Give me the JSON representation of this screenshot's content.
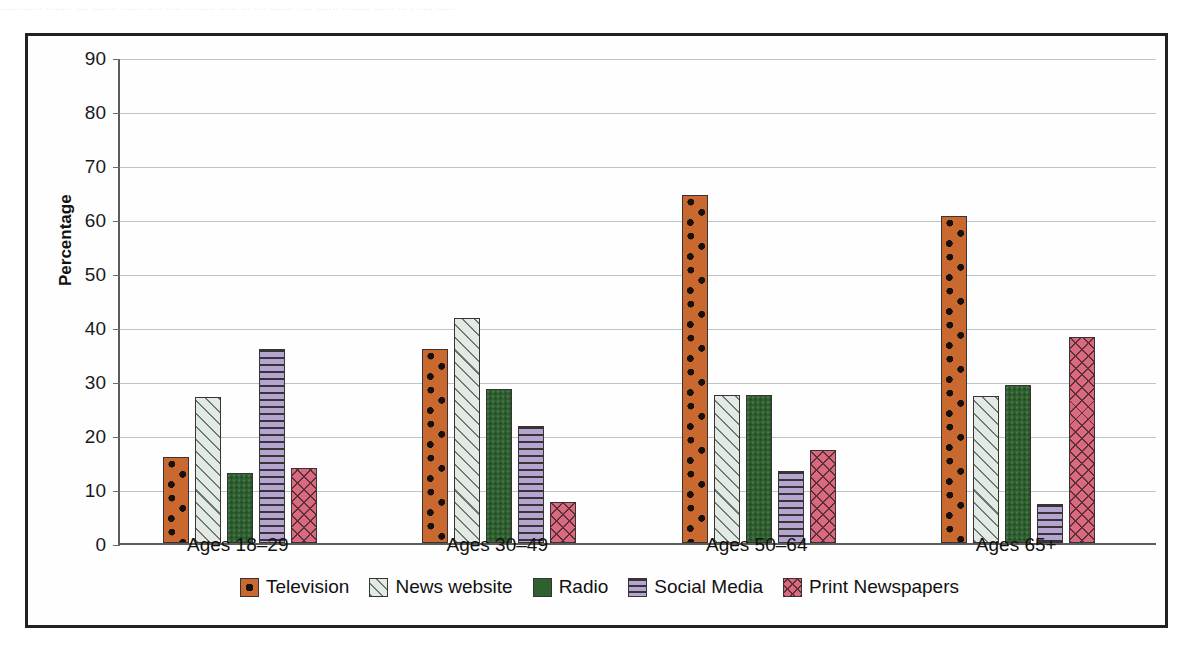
{
  "page": {
    "cropped_header_text": "............. ........ .... ........ ....... ..... ..... ......... ...... ... .... ....... . ... ....... ......... ...... ... . ..... ......"
  },
  "chart_data": {
    "type": "bar",
    "title": "",
    "xlabel": "",
    "ylabel": "Percentage",
    "ylim": [
      0,
      90
    ],
    "yticks": [
      0,
      10,
      20,
      30,
      40,
      50,
      60,
      70,
      80,
      90
    ],
    "ytick_labels": [
      "0",
      "10",
      "20",
      "30",
      "40",
      "50",
      "60",
      "70",
      "80",
      "90"
    ],
    "grid": true,
    "legend_position": "bottom",
    "categories": [
      "Ages 18–29",
      "Ages 30–49",
      "Ages 50–64",
      "Ages 65+"
    ],
    "series": [
      {
        "name": "Television",
        "key": "television",
        "color": "#c9682f",
        "pattern": "dots",
        "values": [
          16,
          36,
          64.5,
          60.5
        ]
      },
      {
        "name": "News website",
        "key": "news-website",
        "color": "#e3e9e3",
        "pattern": "diagonal-hatch",
        "values": [
          27,
          41.7,
          27.5,
          27.2
        ]
      },
      {
        "name": "Radio",
        "key": "radio",
        "color": "#2f6130",
        "pattern": "solid",
        "values": [
          13,
          28.6,
          27.5,
          29.2
        ]
      },
      {
        "name": "Social Media",
        "key": "social-media",
        "color": "#b4a4d0",
        "pattern": "horizontal-stripes",
        "values": [
          36,
          21.6,
          13.4,
          7.3
        ]
      },
      {
        "name": "Print Newspapers",
        "key": "print-newspapers",
        "color": "#d9697f",
        "pattern": "cross-hatch",
        "values": [
          13.9,
          7.6,
          17.3,
          38.1
        ]
      }
    ]
  }
}
